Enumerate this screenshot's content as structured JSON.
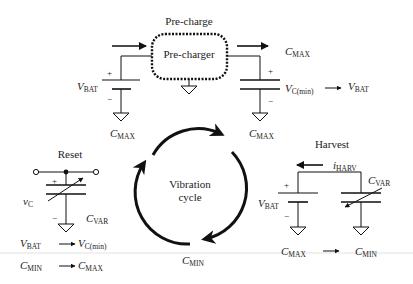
{
  "precharge": {
    "title": "Pre-charge",
    "box_label": "Pre-charger",
    "left_label": {
      "main": "V",
      "sub": "BAT"
    },
    "left_bottom": {
      "main": "C",
      "sub": "MAX"
    },
    "right_top": {
      "main": "C",
      "sub": "MAX"
    },
    "right_transition_from": {
      "main": "V",
      "sub": "C(min)"
    },
    "right_transition_to": {
      "main": "V",
      "sub": "BAT"
    },
    "right_bottom": {
      "main": "C",
      "sub": "MAX"
    },
    "plus": "+",
    "minus": "−"
  },
  "reset": {
    "title": "Reset",
    "cap_voltage": {
      "main": "v",
      "sub": "C"
    },
    "cap_label": {
      "main": "C",
      "sub": "VAR"
    },
    "row1_from": {
      "main": "V",
      "sub": "BAT"
    },
    "row1_to": {
      "main": "V",
      "sub": "C(min)"
    },
    "row2_from": {
      "main": "C",
      "sub": "MIN"
    },
    "row2_to": {
      "main": "C",
      "sub": "MAX"
    },
    "plus": "+",
    "minus": "−"
  },
  "cycle": {
    "line1": "Vibration",
    "line2": "cycle",
    "bottom_label": {
      "main": "C",
      "sub": "MIN"
    }
  },
  "harvest": {
    "title": "Harvest",
    "current_label": {
      "main": "i",
      "sub": "HARV"
    },
    "battery_label": {
      "main": "V",
      "sub": "BAT"
    },
    "cap_label": {
      "main": "C",
      "sub": "VAR"
    },
    "from": {
      "main": "C",
      "sub": "MAX"
    },
    "to": {
      "main": "C",
      "sub": "MIN"
    },
    "plus": "+",
    "minus": "−"
  },
  "colors": {
    "ink": "#111111",
    "text": "#222222",
    "rule": "#dddddd"
  }
}
